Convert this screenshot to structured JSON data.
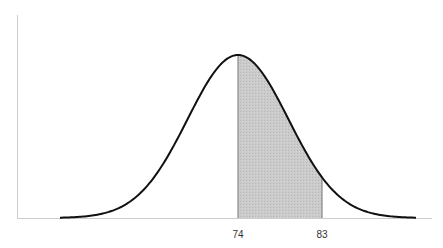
{
  "chart_data": {
    "type": "area",
    "title": "",
    "xlabel": "",
    "ylabel": "",
    "distribution": {
      "mean": 74,
      "sd_estimate": 5.4
    },
    "shaded_region": {
      "from": 74,
      "to": 83
    },
    "x_tick_labels": [
      "74",
      "83"
    ],
    "x_ticks": [
      74,
      83
    ],
    "grid": false,
    "legend": null
  },
  "colors": {
    "curve": "#111111",
    "axis": "#cccccc",
    "shade": "#c9c9c9",
    "shade_edge": "#777777"
  }
}
